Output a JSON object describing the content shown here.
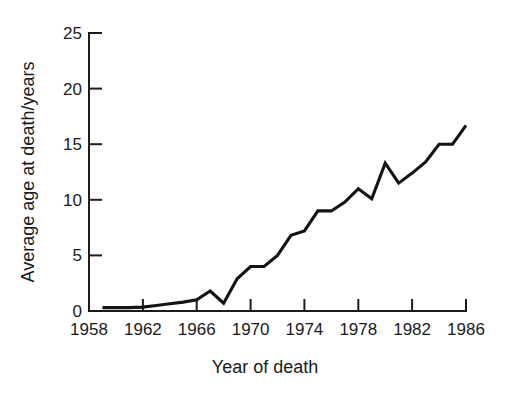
{
  "chart_data": {
    "type": "line",
    "title": "",
    "xlabel": "Year of death",
    "ylabel": "Average age at death/years",
    "xlim": [
      1958,
      1986
    ],
    "ylim": [
      0,
      25
    ],
    "grid": false,
    "legend": null,
    "xticks": [
      1958,
      1962,
      1966,
      1970,
      1974,
      1978,
      1982,
      1986
    ],
    "yticks": [
      0,
      5,
      10,
      15,
      20,
      25
    ],
    "xtick_labels": [
      "1958",
      "1962",
      "1966",
      "1970",
      "1974",
      "1978",
      "1982",
      "1986"
    ],
    "ytick_labels": [
      "0",
      "5",
      "10",
      "15",
      "20",
      "25"
    ],
    "series": [
      {
        "name": "Average age at death",
        "x": [
          1959,
          1960,
          1961,
          1962,
          1963,
          1964,
          1965,
          1966,
          1967,
          1968,
          1969,
          1970,
          1971,
          1972,
          1973,
          1974,
          1975,
          1976,
          1977,
          1978,
          1979,
          1980,
          1981,
          1982,
          1983,
          1984,
          1985,
          1986
        ],
        "values": [
          0.3,
          0.3,
          0.3,
          0.35,
          0.5,
          0.65,
          0.8,
          1.0,
          1.8,
          0.7,
          2.9,
          4.0,
          4.0,
          5.0,
          6.8,
          7.2,
          9.0,
          9.0,
          9.8,
          11.0,
          10.1,
          13.3,
          11.5,
          12.4,
          13.4,
          15.0,
          15.0,
          16.7
        ]
      }
    ]
  },
  "axes": {
    "y_axis_title": "Average age at death/years",
    "x_axis_title": "Year of death"
  }
}
